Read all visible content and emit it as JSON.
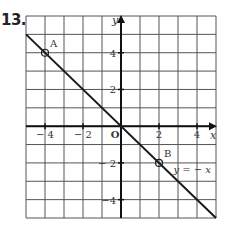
{
  "problem": {
    "number": "13."
  },
  "chart_data": {
    "type": "line",
    "title": "",
    "xlabel": "x",
    "ylabel": "y",
    "xlim": [
      -5,
      5
    ],
    "ylim": [
      -5,
      6
    ],
    "grid": true,
    "x_ticks": [
      -4,
      -2,
      2,
      4
    ],
    "y_ticks": [
      4,
      2,
      -2,
      -4
    ],
    "x_tick_labels": [
      "− 4",
      "− 2",
      "2",
      "4"
    ],
    "y_tick_labels": [
      "4",
      "2",
      "− 2",
      "−4"
    ],
    "origin_label": "O",
    "series": [
      {
        "name": "y = − x",
        "x": [
          -5,
          5
        ],
        "y": [
          5,
          -5
        ]
      }
    ],
    "points": [
      {
        "label": "A",
        "x": -4,
        "y": 4
      },
      {
        "label": "B",
        "x": 2,
        "y": -2
      }
    ],
    "annotations": [
      {
        "text": "y = − x",
        "x": 3.6,
        "y": -2.4
      }
    ]
  }
}
